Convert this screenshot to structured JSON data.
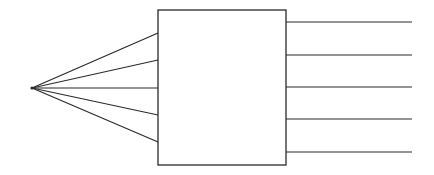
{
  "diagram": {
    "type": "fan-in-box-fan-out",
    "stroke_color": "#2a2a2a",
    "background": "#ffffff",
    "source_point": {
      "x": 32,
      "y": 88
    },
    "box": {
      "x": 158,
      "y": 10,
      "width": 128,
      "height": 155
    },
    "input_lines": [
      {
        "x1": 32,
        "y1": 88,
        "x2": 158,
        "y2": 33
      },
      {
        "x1": 32,
        "y1": 88,
        "x2": 158,
        "y2": 60
      },
      {
        "x1": 32,
        "y1": 88,
        "x2": 158,
        "y2": 88
      },
      {
        "x1": 32,
        "y1": 88,
        "x2": 158,
        "y2": 115
      },
      {
        "x1": 32,
        "y1": 88,
        "x2": 158,
        "y2": 142
      }
    ],
    "output_lines": [
      {
        "x1": 286,
        "y1": 22,
        "x2": 412,
        "y2": 22
      },
      {
        "x1": 286,
        "y1": 55,
        "x2": 412,
        "y2": 55
      },
      {
        "x1": 286,
        "y1": 87,
        "x2": 412,
        "y2": 87
      },
      {
        "x1": 286,
        "y1": 119,
        "x2": 412,
        "y2": 119
      },
      {
        "x1": 286,
        "y1": 152,
        "x2": 412,
        "y2": 152
      }
    ]
  }
}
